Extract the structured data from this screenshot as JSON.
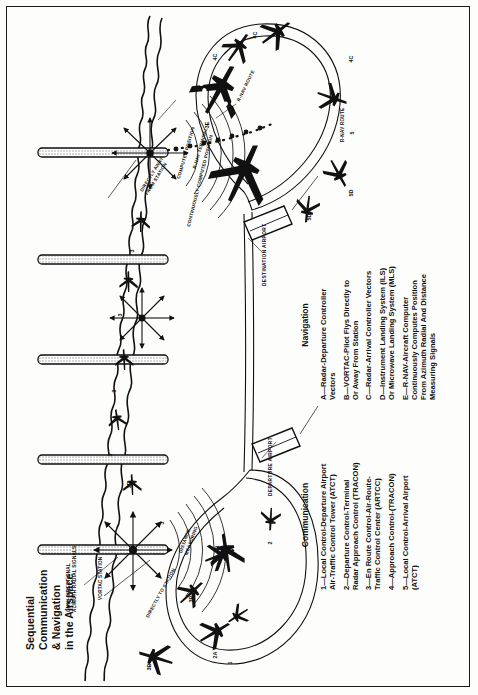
{
  "title": {
    "line1": "Sequential",
    "line2": "Communication",
    "line3": "& Navigation",
    "line4": "in the Airspace"
  },
  "legends": [
    {
      "id": "navigation",
      "heading": "Navigation",
      "items": [
        "A—Radar-Departure Controller\nVectors",
        "B—VORTAC-Pilot Flys Directly to\nOr Away From Station",
        "C—Radar-Arrival Controller Vectors",
        "D—Instrument Landing System (ILS)\nOr Microwave Landing System (MLS)",
        "E—R-NAV-Aircraft Computer\nContinuously Computes Position\nFrom Azimuth Radial And Distance\nMeasuring Signals"
      ]
    },
    {
      "id": "communication",
      "heading": "Communication",
      "items": [
        "1—Local Control-Departure Airport\nAir-Traffic Control Tower (ATCT)",
        "2—Departure Control-Terminal\nRadar Approach Control (TRACON)",
        "3—En Route Control-Air-Route-\nTraffic Control Center (ARTCC)",
        "4—Approach Control-(TRACON)",
        "5—Local Control-Arrival Airport\n(ATCT)"
      ]
    }
  ],
  "map_annotations": {
    "omni": "OMNI-DIRECTIONAL\nAZIMUTH RADIAL SIGNALS",
    "vortac_station": "VORTAC STATION",
    "directly_to_station": "DIRECTLY TO STATION",
    "directly_away_from_station": "DIRECTLY AWAY\nFROM STATION",
    "distance_measuring": "DISTANCE\nMEASURING",
    "continuously_computed_position": "CONTINUOUSLY COMPUTED POSITION",
    "computed_position": "COMPUTED POSITION",
    "rnav_terminal": "R-NAV TERMINAL",
    "rnav_route_upper": "R-NAV ROUTE",
    "rnav_route_right": "R-NAV ROUTE",
    "departure_airport": "DEPARTURE AIRPORT",
    "destination_airport": "DESTINATION AIRPORT"
  },
  "sequence_markers": {
    "communication": [
      "1",
      "2",
      "3",
      "3",
      "3",
      "3",
      "3",
      "4",
      "5"
    ],
    "navigation": [
      "2A",
      "3B",
      "3B",
      "3B",
      "3E",
      "3E",
      "4C",
      "4C",
      "4C",
      "5D",
      "5D"
    ]
  },
  "colors": {
    "ink": "#111111",
    "paper": "#fdfdfc",
    "hatch": "#8a8a8a"
  }
}
